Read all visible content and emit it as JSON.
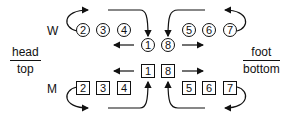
{
  "rows": {
    "w": {
      "label": "W",
      "shape": "circle",
      "center": [
        "1",
        "8"
      ],
      "left": [
        "2",
        "3",
        "4"
      ],
      "right": [
        "5",
        "6",
        "7"
      ]
    },
    "m": {
      "label": "M",
      "shape": "square",
      "center": [
        "1",
        "8"
      ],
      "left": [
        "2",
        "3",
        "4"
      ],
      "right": [
        "5",
        "6",
        "7"
      ]
    }
  },
  "left_label": {
    "top": "head",
    "bottom": "top"
  },
  "right_label": {
    "top": "foot",
    "bottom": "bottom"
  },
  "colors": {
    "ink": "#111111",
    "background": "#ffffff"
  }
}
